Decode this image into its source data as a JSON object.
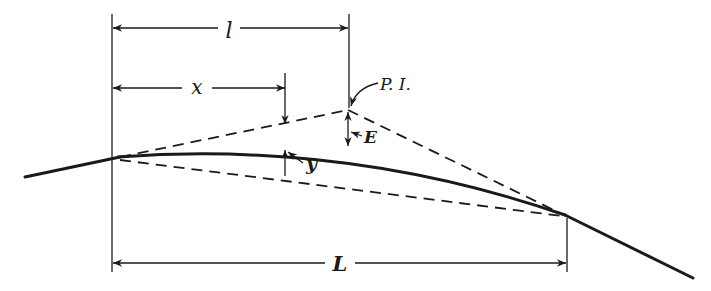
{
  "diagram": {
    "labels": {
      "half_length": "l",
      "distance": "x",
      "pi": "P. I.",
      "external": "E",
      "offset": "y",
      "length": "L"
    },
    "colors": {
      "ink": "#1a1a1a",
      "background": "#ffffff"
    },
    "points": {
      "bvc": [
        118,
        158
      ],
      "pi": [
        348,
        110
      ],
      "evc": [
        565,
        215
      ]
    }
  }
}
